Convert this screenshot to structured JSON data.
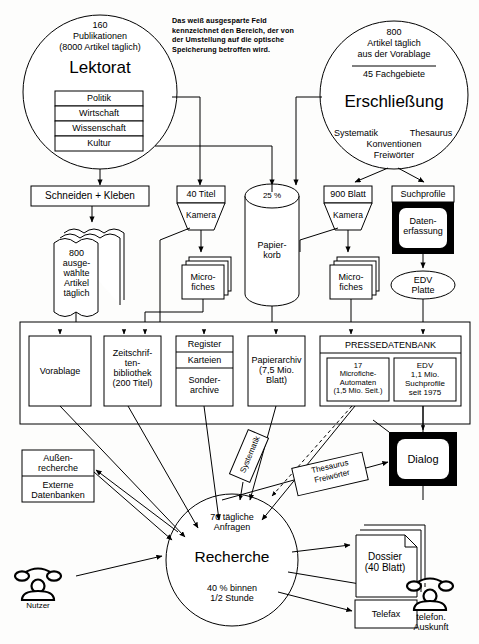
{
  "diagram": {
    "note": [
      "Das weiß ausgesparte Feld",
      "kennzeichnet den Bereich, der von",
      "der Umstellung auf die optische",
      "Speicherung betroffen wird."
    ],
    "colors": {
      "ink": "#000000",
      "paper": "#fdfdfc",
      "fill": "#ffffff"
    }
  },
  "lektorat": {
    "count": "160",
    "line2": "Publikationen",
    "line3": "(8000 Artikel täglich)",
    "heading": "Lektorat",
    "subjects": [
      "Politik",
      "Wirtschaft",
      "Wissenschaft",
      "Kultur"
    ]
  },
  "erschliessung": {
    "count": "800",
    "line2": "Artikel täglich",
    "line3": "aus der Vorablage",
    "line4": "45 Fachgebiete",
    "heading": "Erschließung",
    "methods_left": "Systematik",
    "methods_right": "Thesaurus",
    "methods_mid": "Konventionen",
    "methods_bottom": "Freiwörter"
  },
  "process": {
    "schneiden": "Schneiden + Kleben",
    "artikel_stack": [
      "800",
      "ausge-",
      "wählte",
      "Artikel",
      "täglich"
    ],
    "titel40": "40 Titel",
    "kamera_left": "Kamera",
    "microfiches_left": [
      "Micro-",
      "fiches"
    ],
    "papierkorb_pct": "25 %",
    "papierkorb": [
      "Papier-",
      "korb"
    ],
    "blatt900": "900 Blatt",
    "kamera_right": "Kamera",
    "microfiches_right": [
      "Micro-",
      "fiches"
    ],
    "suchprofile": "Suchprofile",
    "datenerfassung": [
      "Daten-",
      "erfassung"
    ],
    "edv_platte": [
      "EDV",
      "Platte"
    ]
  },
  "archive": {
    "vorablage": "Vorablage",
    "zeitschriften": [
      "Zeitschrif-",
      "ten-",
      "bibliothek",
      "(200 Titel)"
    ],
    "register": [
      "Register",
      "Karteien"
    ],
    "sonderarchive": [
      "Sonder-",
      "archive"
    ],
    "papierarchiv": [
      "Papierarchiv",
      "(7,5 Mio.",
      "Blatt)"
    ],
    "pressedatenbank": "PRESSEDATENBANK",
    "microfiche_automaten": [
      "17",
      "Microfiche-",
      "Automaten",
      "(1,5 Mio. Seit.)"
    ],
    "edv_suchprofile": [
      "EDV",
      "1,1 Mio.",
      "Suchprofile",
      "seit 1975"
    ]
  },
  "search": {
    "aussenrecherche": [
      "Außen-",
      "recherche"
    ],
    "externe_datenbanken": [
      "Externe",
      "Datenbanken"
    ],
    "systematik_label": "Systematik",
    "thesaurus_label": [
      "Thesaurus",
      "Freiwörter"
    ],
    "dialog": "Dialog",
    "recherche_top": [
      "70 tägliche",
      "Anfragen"
    ],
    "recherche_heading": "Recherche",
    "recherche_bottom": [
      "40 % binnen",
      "1/2 Stunde"
    ]
  },
  "outputs": {
    "dossier": [
      "Dossier",
      "(40 Blatt)"
    ],
    "telefax": "Telefax",
    "nutzer": "Nutzer",
    "telefon_auskunft": [
      "telefon.",
      "Auskunft"
    ]
  },
  "icons": {
    "phone_user": "telephone-icon",
    "phone_info": "telephone-icon",
    "monitor_dialog": "crt-monitor-icon",
    "monitor_capture": "crt-monitor-icon"
  }
}
